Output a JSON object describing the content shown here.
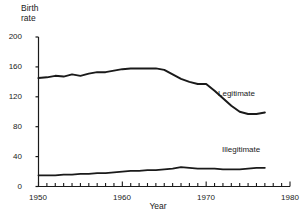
{
  "chart_data": {
    "type": "line",
    "title": "",
    "xlabel": "Year",
    "ylabel": "Birth rate",
    "ylabel_lines": [
      "Birth",
      "rate"
    ],
    "xlim": [
      1950,
      1980
    ],
    "ylim": [
      0,
      200
    ],
    "yticks": [
      0,
      40,
      80,
      120,
      160,
      200
    ],
    "ytick_labels": [
      "0",
      "40",
      "80",
      "120",
      "160",
      "200"
    ],
    "xticks": [
      1950,
      1960,
      1970,
      1980
    ],
    "xtick_labels": [
      "1950",
      "1960",
      "1970",
      "1980"
    ],
    "xtick_minor_step": 1,
    "grid": false,
    "legend_position": "inline-annotation",
    "line_color": "#1a1a1a",
    "x": [
      1950,
      1951,
      1952,
      1953,
      1954,
      1955,
      1956,
      1957,
      1958,
      1959,
      1960,
      1961,
      1962,
      1963,
      1964,
      1965,
      1966,
      1967,
      1968,
      1969,
      1970,
      1971,
      1972,
      1973,
      1974,
      1975,
      1976,
      1977
    ],
    "series": [
      {
        "name": "Legitimate",
        "label": "Legitimate",
        "values": [
          145,
          146,
          148,
          147,
          150,
          148,
          151,
          153,
          153,
          155,
          157,
          158,
          158,
          158,
          158,
          156,
          150,
          144,
          140,
          137,
          137,
          128,
          118,
          108,
          100,
          97,
          97,
          99
        ]
      },
      {
        "name": "Illegitimate",
        "label": "Illegitimate",
        "values": [
          15,
          15,
          15,
          16,
          16,
          17,
          17,
          18,
          18,
          19,
          20,
          21,
          21,
          22,
          22,
          23,
          24,
          26,
          25,
          24,
          24,
          24,
          23,
          23,
          23,
          24,
          25,
          25
        ]
      }
    ],
    "annotations": [
      {
        "text": "Legitimate",
        "x": 1973,
        "y": 118
      },
      {
        "text": "Illegitimate",
        "x": 1971,
        "y": 50
      }
    ]
  }
}
